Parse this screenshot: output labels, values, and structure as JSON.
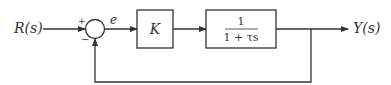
{
  "diagram": {
    "type": "block-diagram",
    "input_label": "R(s)",
    "output_label": "Y(s)",
    "error_label": "e",
    "summing_junction": {
      "plus_sign": "+",
      "minus_sign": "−"
    },
    "blocks": [
      {
        "label": "K"
      },
      {
        "numerator": "1",
        "denominator": "1 + τs"
      }
    ],
    "feedback": "unity negative feedback",
    "colors": {
      "line": "#333333",
      "background": "#ffffff"
    }
  }
}
